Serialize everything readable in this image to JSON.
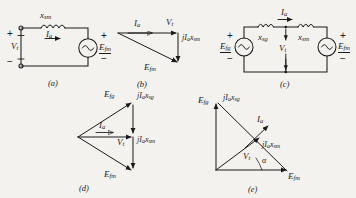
{
  "figure": {
    "kind": "circuit-and-phasor-diagram-plate",
    "background_color": "#f3f2ef",
    "ink_color": "#1a1a1a",
    "panel_labels": [
      "(a)",
      "(b)",
      "(c)",
      "(d)",
      "(e)"
    ]
  },
  "symbols": {
    "Vt": {
      "base": "V",
      "sub": "t"
    },
    "Ia": {
      "base": "I",
      "sub": "a"
    },
    "Efm": {
      "base": "E",
      "sub": "fm"
    },
    "Efg": {
      "base": "E",
      "sub": "fg"
    },
    "xsm": {
      "base": "x",
      "sub": "sm"
    },
    "xsg": {
      "base": "x",
      "sub": "sg"
    },
    "jIaxsm": {
      "text": "jI",
      "sub1": "a",
      "text2": "x",
      "sub2": "sm"
    },
    "jIaxsg": {
      "text": "jI",
      "sub1": "a",
      "text2": "x",
      "sub2": "sg"
    },
    "alpha": "α",
    "plus": "+",
    "minus": "−"
  },
  "panel_a": {
    "label": "(a)",
    "type": "circuit",
    "terminal_voltage": {
      "base": "V",
      "sub": "t"
    },
    "reactance": {
      "base": "x",
      "sub": "sm"
    },
    "current": {
      "base": "I",
      "sub": "a"
    },
    "source": {
      "base": "E",
      "sub": "fm"
    },
    "left_plus": "+",
    "left_minus": "−",
    "right_plus": "+",
    "right_minus": "−",
    "elements": [
      "open-terminal-pair",
      "inductor",
      "ac-source"
    ]
  },
  "panel_b": {
    "label": "(b)",
    "type": "phasor",
    "vectors": [
      {
        "name": "Ia",
        "base": "I",
        "sub": "a"
      },
      {
        "name": "Vt",
        "base": "V",
        "sub": "t"
      },
      {
        "name": "jIaxsm",
        "text": "jI",
        "sub1": "a",
        "text2": "x",
        "sub2": "sm"
      },
      {
        "name": "Efm",
        "base": "E",
        "sub": "fm"
      }
    ]
  },
  "panel_c": {
    "label": "(c)",
    "type": "circuit",
    "left_source": {
      "base": "E",
      "sub": "fg"
    },
    "right_source": {
      "base": "E",
      "sub": "fm"
    },
    "left_reactance": {
      "base": "x",
      "sub": "sg"
    },
    "right_reactance": {
      "base": "x",
      "sub": "sm"
    },
    "current": {
      "base": "I",
      "sub": "a"
    },
    "mid_voltage": {
      "base": "V",
      "sub": "t"
    },
    "left_plus": "+",
    "left_minus": "−",
    "right_plus": "+",
    "right_minus": "−",
    "elements": [
      "ac-source",
      "inductor",
      "inductor",
      "ac-source"
    ]
  },
  "panel_d": {
    "label": "(d)",
    "type": "phasor",
    "vectors": [
      {
        "name": "Efg",
        "base": "E",
        "sub": "fg"
      },
      {
        "name": "jIaxsg",
        "text": "jI",
        "sub1": "a",
        "text2": "x",
        "sub2": "sg"
      },
      {
        "name": "Ia",
        "base": "I",
        "sub": "a"
      },
      {
        "name": "Vt",
        "base": "V",
        "sub": "t"
      },
      {
        "name": "jIaxsm",
        "text": "jI",
        "sub1": "a",
        "text2": "x",
        "sub2": "sm"
      },
      {
        "name": "Efm",
        "base": "E",
        "sub": "fm"
      }
    ]
  },
  "panel_e": {
    "label": "(e)",
    "type": "phasor",
    "vectors": [
      {
        "name": "Efg",
        "base": "E",
        "sub": "fg"
      },
      {
        "name": "jIaxsg",
        "text": "jI",
        "sub1": "a",
        "text2": "x",
        "sub2": "sg"
      },
      {
        "name": "Ia",
        "base": "I",
        "sub": "a"
      },
      {
        "name": "jIaxsm",
        "text": "jI",
        "sub1": "a",
        "text2": "x",
        "sub2": "sm"
      },
      {
        "name": "Vt",
        "base": "V",
        "sub": "t"
      },
      {
        "name": "Efm",
        "base": "E",
        "sub": "fm"
      }
    ],
    "angle_label": "α"
  }
}
